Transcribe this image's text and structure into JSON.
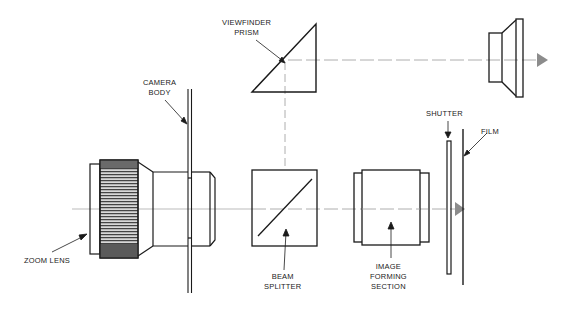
{
  "diagram": {
    "title": "",
    "type": "optical schematic of camera with zoom lens",
    "colors": {
      "line": "#1a1a1a",
      "dashed_axis": "#999999",
      "arrowhead_gray": "#8c8c8c",
      "background": "#ffffff"
    },
    "labels": {
      "viewfinder_prism": "VIEWFINDER\nPRISM",
      "camera_body": "CAMERA\nBODY",
      "zoom_lens": "ZOOM LENS",
      "beam_splitter": "BEAM\nSPLITTER",
      "image_forming_section": "IMAGE\nFORMING\nSECTION",
      "shutter": "SHUTTER",
      "film": "FILM"
    },
    "components": [
      "zoom-lens",
      "camera-body",
      "beam-splitter",
      "viewfinder-prism",
      "eyepiece",
      "image-forming-section",
      "shutter",
      "film"
    ]
  }
}
